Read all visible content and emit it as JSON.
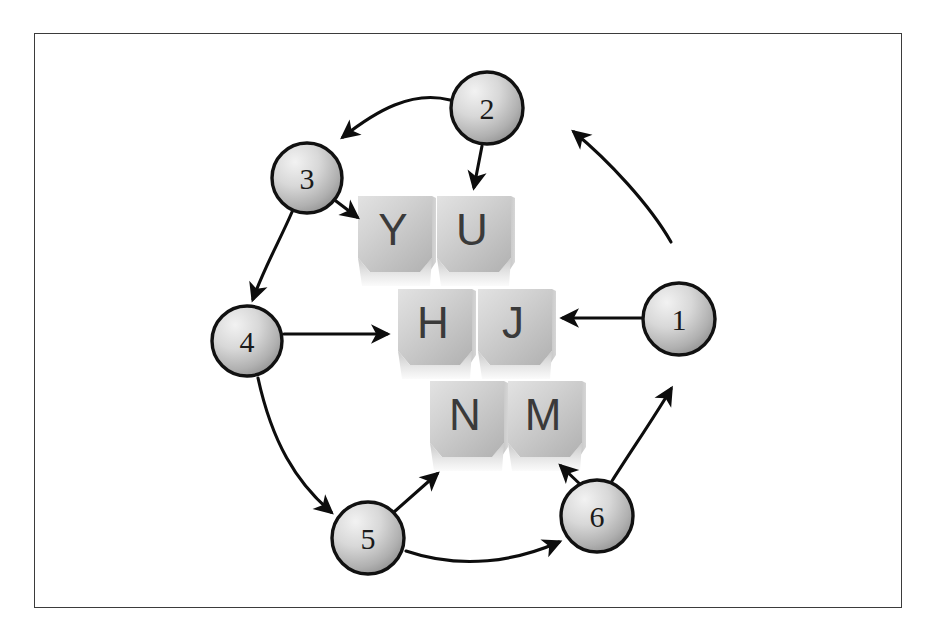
{
  "diagram": {
    "frame": {
      "border_color": "#3b3b3b",
      "background": "#ffffff"
    },
    "nodes": [
      {
        "id": "n1",
        "label": "1",
        "cx": 679,
        "cy": 319,
        "r": 36
      },
      {
        "id": "n2",
        "label": "2",
        "cx": 487,
        "cy": 108,
        "r": 36
      },
      {
        "id": "n3",
        "label": "3",
        "cx": 307,
        "cy": 178,
        "r": 35
      },
      {
        "id": "n4",
        "label": "4",
        "cx": 247,
        "cy": 341,
        "r": 35
      },
      {
        "id": "n5",
        "label": "5",
        "cx": 368,
        "cy": 538,
        "r": 36
      },
      {
        "id": "n6",
        "label": "6",
        "cx": 597,
        "cy": 516,
        "r": 36
      }
    ],
    "node_colors": {
      "fill_light": "#e8e8e8",
      "fill_dark": "#9a9a9a",
      "stroke": "#111111"
    },
    "keys": [
      {
        "id": "key-y",
        "label": "Y",
        "x": 358,
        "y": 196,
        "w": 74,
        "h": 90
      },
      {
        "id": "key-u",
        "label": "U",
        "x": 437,
        "y": 196,
        "w": 74,
        "h": 90
      },
      {
        "id": "key-h",
        "label": "H",
        "x": 398,
        "y": 289,
        "w": 74,
        "h": 90
      },
      {
        "id": "key-j",
        "label": "J",
        "x": 478,
        "y": 289,
        "w": 74,
        "h": 90
      },
      {
        "id": "key-n",
        "label": "N",
        "x": 430,
        "y": 381,
        "w": 74,
        "h": 90
      },
      {
        "id": "key-m",
        "label": "M",
        "x": 508,
        "y": 381,
        "w": 74,
        "h": 90
      }
    ],
    "key_colors": {
      "top_light": "#efefef",
      "top_dark": "#b9b9b9",
      "side_dark": "#a6a6a6",
      "letter": "#3a3a3a"
    },
    "arrows": [
      {
        "id": "arrow-1-to-2",
        "name": "arrow-node1-to-node2",
        "from": "n1",
        "to": "n2",
        "path": "M 671,242 C 650,205 608,160 574,132",
        "kind": "curved"
      },
      {
        "id": "arrow-2-to-3",
        "name": "arrow-node2-to-node3",
        "from": "n2",
        "to": "n3",
        "path": "M 450,100 C 410,92 375,112 342,137",
        "kind": "curved"
      },
      {
        "id": "arrow-2-to-u",
        "name": "arrow-node2-to-key-u",
        "from": "n2",
        "to": "key-u",
        "path": "M 482,146 L 474,188",
        "kind": "straight"
      },
      {
        "id": "arrow-3-to-y",
        "name": "arrow-node3-to-key-y",
        "from": "n3",
        "to": "key-y",
        "path": "M 334,199 L 358,218",
        "kind": "straight"
      },
      {
        "id": "arrow-3-to-4",
        "name": "arrow-node3-to-node4",
        "from": "n3",
        "to": "n4",
        "path": "M 293,213 C 280,240 265,268 254,300",
        "kind": "curved"
      },
      {
        "id": "arrow-4-to-h",
        "name": "arrow-node4-to-key-h",
        "from": "n4",
        "to": "key-h",
        "path": "M 284,334 L 388,334",
        "kind": "straight"
      },
      {
        "id": "arrow-4-to-5",
        "name": "arrow-node4-to-node5",
        "from": "n4",
        "to": "node5",
        "path": "M 258,378 C 272,440 295,480 330,512",
        "kind": "curved"
      },
      {
        "id": "arrow-1-to-j",
        "name": "arrow-node1-to-key-j",
        "from": "n1",
        "to": "key-j",
        "path": "M 642,318 L 562,318",
        "kind": "straight"
      },
      {
        "id": "arrow-6-to-1",
        "name": "arrow-node6-to-node1",
        "from": "n6",
        "to": "n1",
        "path": "M 612,481 C 634,447 655,415 672,388",
        "kind": "curved"
      },
      {
        "id": "arrow-5-to-n",
        "name": "arrow-node5-to-key-n",
        "from": "n5",
        "to": "key-n",
        "path": "M 395,513 L 437,474",
        "kind": "straight"
      },
      {
        "id": "arrow-6-to-m",
        "name": "arrow-node6-to-key-m",
        "from": "n6",
        "to": "key-m",
        "path": "M 582,486 L 561,467",
        "kind": "straight"
      },
      {
        "id": "arrow-5-to-6",
        "name": "arrow-node5-to-node6",
        "from": "n5",
        "to": "n6",
        "path": "M 406,551 C 460,569 515,562 558,542",
        "kind": "curved"
      }
    ],
    "arrow_color": "#0d0d0d"
  }
}
